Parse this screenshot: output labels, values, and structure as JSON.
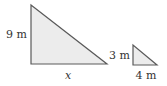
{
  "figure": {
    "colors": {
      "fill": "#ececec",
      "stroke": "#5a5a5a",
      "text": "#333333"
    },
    "large_triangle": {
      "vertices": {
        "top": [
          31,
          5
        ],
        "bottom_left": [
          31,
          64
        ],
        "bottom_right": [
          107,
          64
        ]
      },
      "height_label": "9 m",
      "base_label": "x"
    },
    "small_triangle": {
      "vertices": {
        "top": [
          133,
          45
        ],
        "bottom_left": [
          133,
          65
        ],
        "bottom_right": [
          157,
          65
        ]
      },
      "height_label": "3 m",
      "base_label": "4 m"
    }
  }
}
